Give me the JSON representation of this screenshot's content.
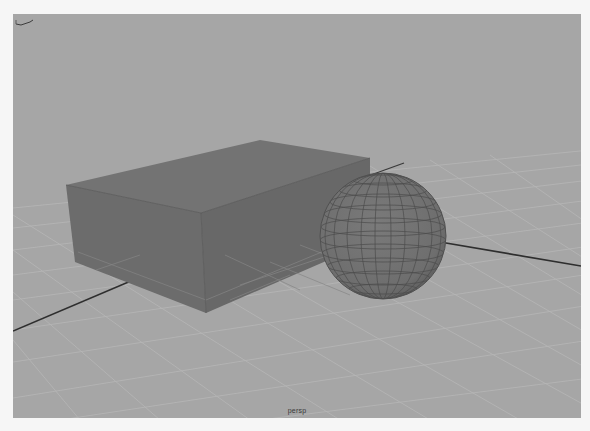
{
  "viewport": {
    "camera_name": "persp",
    "background_color": "#a6a6a6",
    "grid_color": "#b4b4b4",
    "axis_line_color": "#2e2e2e"
  },
  "scene": {
    "objects": [
      {
        "type": "polyCube",
        "shading": "flat-gray",
        "color": "#6e6e6e"
      },
      {
        "type": "polySphere",
        "shading": "wireframe-on-shaded",
        "color": "#727272",
        "wire_color": "#4a4a4a"
      }
    ]
  },
  "gizmo": {
    "icon": "axis-orientation-icon"
  }
}
